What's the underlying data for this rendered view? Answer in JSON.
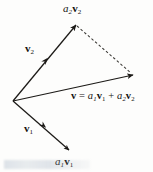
{
  "figure": {
    "width": 153,
    "height": 172,
    "background_color": "#fdfdfc",
    "stroke_color": "#1c1a17",
    "dashed_color": "#3a3834"
  },
  "labels": {
    "a2v2": {
      "coef": "a",
      "coef_sub": "2",
      "vec": "v",
      "vec_sub": "2",
      "full_text": "a2v2"
    },
    "v2": {
      "vec": "v",
      "vec_sub": "2",
      "full_text": "v2"
    },
    "v1": {
      "vec": "v",
      "vec_sub": "1",
      "full_text": "v1"
    },
    "a1v1": {
      "coef": "a",
      "coef_sub": "1",
      "vec": "v",
      "vec_sub": "1",
      "full_text": "a1v1"
    },
    "equation": {
      "lhs": "v",
      "equals": "=",
      "term1_coef": "a",
      "term1_coef_sub": "1",
      "term1_vec": "v",
      "term1_vec_sub": "1",
      "plus": "+",
      "term2_coef": "a",
      "term2_coef_sub": "2",
      "term2_vec": "v",
      "term2_vec_sub": "2",
      "full_text": "v = a1v1 + a2v2"
    }
  },
  "geometry": {
    "origin": {
      "x": 13,
      "y": 101
    },
    "vectors": [
      {
        "name": "a2v2",
        "from": {
          "x": 13,
          "y": 101
        },
        "to": {
          "x": 76,
          "y": 25
        },
        "style": "solid",
        "tip_arrow": true,
        "mid_arrow_at": {
          "x": 46,
          "y": 60
        }
      },
      {
        "name": "v",
        "from": {
          "x": 13,
          "y": 101
        },
        "to": {
          "x": 133,
          "y": 75
        },
        "style": "solid",
        "tip_arrow": true,
        "mid_arrow_at": null
      },
      {
        "name": "a1v1",
        "from": {
          "x": 13,
          "y": 101
        },
        "to": {
          "x": 69,
          "y": 150
        },
        "style": "solid",
        "tip_arrow": true,
        "mid_arrow_at": {
          "x": 44,
          "y": 126
        }
      },
      {
        "name": "closing-dashed",
        "from": {
          "x": 76,
          "y": 25
        },
        "to": {
          "x": 133,
          "y": 75
        },
        "style": "dashed",
        "tip_arrow": false,
        "mid_arrow_at": null
      }
    ]
  }
}
